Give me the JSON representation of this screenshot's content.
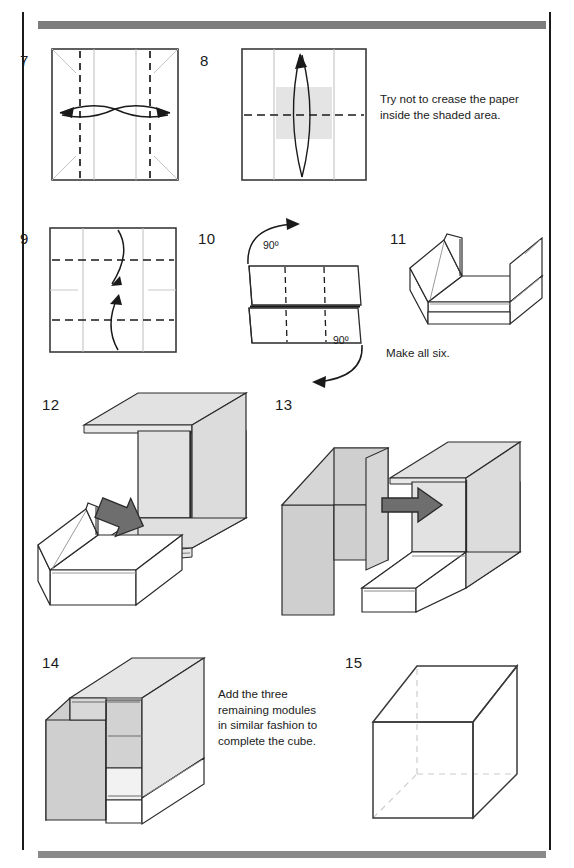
{
  "page": {
    "kind": "origami-instruction-page",
    "rule_color": "#1b1b1b",
    "bar_color": "#7d7d7d",
    "shade_color": "#d9d9d9",
    "arrow_gray": "#6e6e6e",
    "crease_gray": "#b9b9b9",
    "line_black": "#1a1a1a"
  },
  "steps": [
    {
      "number": "7",
      "caption": "",
      "diagram": "square with two vertical valley-fold dashed lines and paired curved double-headed arrows"
    },
    {
      "number": "8",
      "caption": "",
      "diagram": "square with horizontal dashed fold line, shaded center band, and lens-shaped up arrow"
    },
    {
      "number": "9",
      "caption": "",
      "diagram": "square with two horizontal dashed fold lines and an S-curve double-headed arrow"
    },
    {
      "number": "10",
      "caption": "",
      "diagram": "folded rectangle with two 90 degree rotation arrows",
      "labels": [
        "90º",
        "90º"
      ]
    },
    {
      "number": "11",
      "caption": "Make all six.",
      "diagram": "three dimensional U shaped module"
    },
    {
      "number": "12",
      "caption": "",
      "diagram": "shaded module above a white module with gray insertion arrow"
    },
    {
      "number": "13",
      "caption": "",
      "diagram": "two joined modules with gray arrow pointing right"
    },
    {
      "number": "14",
      "caption": "Add the three remaining modules in similar fashion to complete the cube.",
      "diagram": "partially assembled shaded cube"
    },
    {
      "number": "15",
      "caption": "",
      "diagram": "finished wireframe cube with hidden edges dashed"
    }
  ],
  "notes": {
    "step8": "Try not to crease the paper inside the shaded area.",
    "step11": "Make all six.",
    "step14": "Add the three remaining modules in similar fashion to complete the cube."
  },
  "angles": {
    "top": "90º",
    "bottom": "90º"
  }
}
